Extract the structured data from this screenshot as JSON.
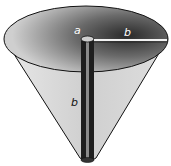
{
  "diagram": {
    "type": "inverted-cone",
    "labels": {
      "inner_radius": "a",
      "top_radius": "b",
      "height": "b"
    },
    "colors": {
      "outline": "#111111",
      "surface_light": "#d9d9d9",
      "surface_dark": "#3a3a3a",
      "rod": "#1e1e1e"
    }
  }
}
